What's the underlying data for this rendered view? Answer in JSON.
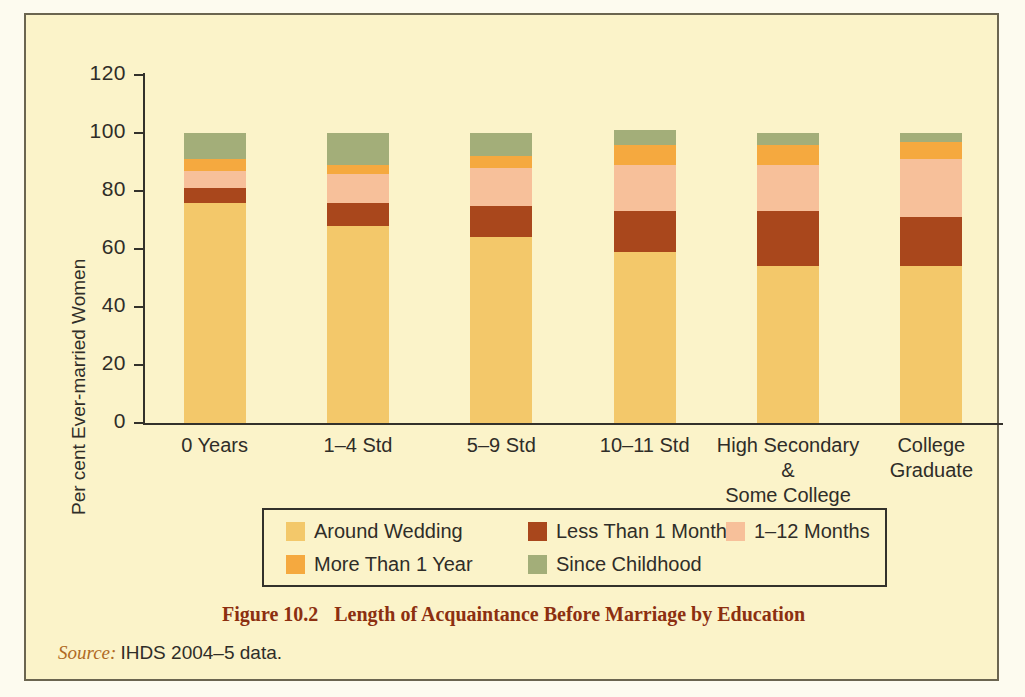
{
  "figure": {
    "caption_number": "Figure 10.2",
    "caption_text": "Length of Acquaintance Before Marriage by Education",
    "source_key": "Source:",
    "source_text": "IHDS 2004–5 data."
  },
  "chart_data": {
    "type": "bar",
    "subtype": "stacked-vertical-100",
    "title": "Length of Acquaintance Before Marriage by Education",
    "xlabel": "",
    "ylabel": "Per cent Ever-married Women",
    "ylim": [
      0,
      120
    ],
    "yticks": [
      0,
      20,
      40,
      60,
      80,
      100,
      120
    ],
    "grid": false,
    "legend_position": "bottom",
    "categories": [
      "0 Years",
      "1–4 Std",
      "5–9 Std",
      "10–11 Std",
      "High Secondary & Some College",
      "College Graduate"
    ],
    "category_label_lines": [
      [
        "0 Years"
      ],
      [
        "1–4 Std"
      ],
      [
        "5–9 Std"
      ],
      [
        "10–11 Std"
      ],
      [
        "High Secondary &",
        "Some College"
      ],
      [
        "College",
        "Graduate"
      ]
    ],
    "series": [
      {
        "name": "Around Wedding",
        "color": "#F3C86A",
        "values": [
          76,
          68,
          64,
          59,
          54,
          54
        ]
      },
      {
        "name": "Less Than 1 Month",
        "color": "#A9471C",
        "values": [
          5,
          8,
          11,
          14,
          19,
          17
        ]
      },
      {
        "name": "1–12 Months",
        "color": "#F7C09A",
        "values": [
          6,
          10,
          13,
          16,
          16,
          20
        ]
      },
      {
        "name": "More Than 1 Year",
        "color": "#F5A93F",
        "values": [
          4,
          3,
          4,
          7,
          7,
          6
        ]
      },
      {
        "name": "Since Childhood",
        "color": "#A3AE79",
        "values": [
          9,
          11,
          8,
          5,
          4,
          3
        ]
      }
    ],
    "totals": [
      100,
      100,
      100,
      100,
      100,
      100
    ]
  },
  "legend": {
    "items": [
      {
        "label": "Around Wedding",
        "color": "#F3C86A"
      },
      {
        "label": "Less Than 1 Month",
        "color": "#A9471C"
      },
      {
        "label": "1–12 Months",
        "color": "#F7C09A"
      },
      {
        "label": "More Than 1 Year",
        "color": "#F5A93F"
      },
      {
        "label": "Since Childhood",
        "color": "#A3AE79"
      }
    ]
  },
  "colors": {
    "background": "#FBF3C9",
    "frame": "#6b6550",
    "axis": "#33312b",
    "caption": "#8c2f10",
    "source_key": "#b06a24"
  }
}
